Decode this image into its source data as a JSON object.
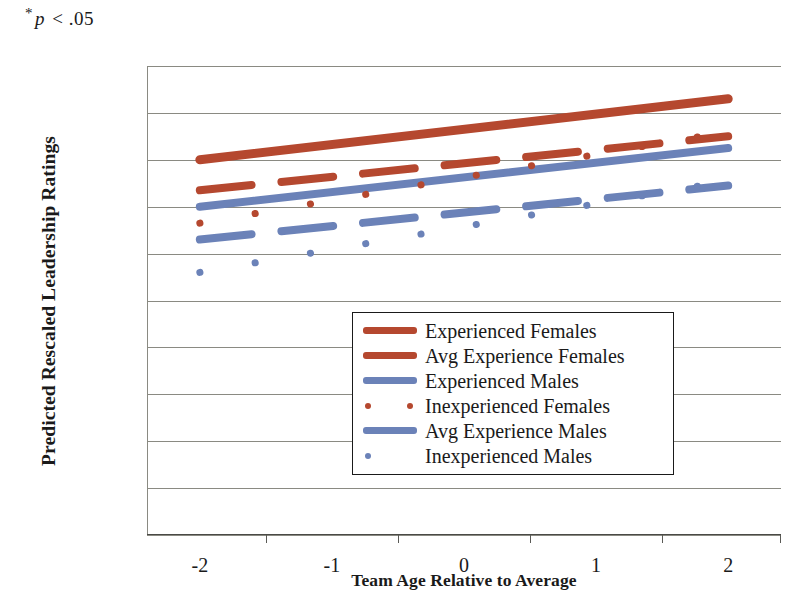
{
  "annotation": {
    "star": "*",
    "p_symbol": "p",
    "text": " < .05",
    "full": "* p < .05"
  },
  "colors": {
    "red": "#b5482f",
    "blue": "#6b82b8",
    "grid": "#8a8a82",
    "axis": "#4a4a46",
    "text": "#1a1a1a"
  },
  "axes": {
    "y_title": "Predicted Rescaled Leadership Ratings",
    "x_title": "Team Age Relative to Average"
  },
  "legend": {
    "items": [
      {
        "label": "Experienced Females",
        "key": "solid-line",
        "color": "#b5482f"
      },
      {
        "label": "Avg Experience Females",
        "key": "solid-line",
        "color": "#b5482f"
      },
      {
        "label": "Experienced Males",
        "key": "solid-line",
        "color": "#6b82b8"
      },
      {
        "label": "Inexperienced Females",
        "key": "dotted-line",
        "color": "#b5482f"
      },
      {
        "label": "Avg Experience Males",
        "key": "solid-line",
        "color": "#6b82b8"
      },
      {
        "label": "Inexperienced Males",
        "key": "dotted-line",
        "color": "#6b82b8"
      }
    ]
  },
  "chart_data": {
    "type": "line",
    "title": "",
    "xlabel": "Team Age Relative to Average",
    "ylabel": "Predicted Rescaled Leadership Ratings",
    "annotation": "* p < .05",
    "xlim": [
      -2.4,
      2.4
    ],
    "ylim": [
      0,
      1
    ],
    "xticks": [
      -2,
      -1,
      0,
      1,
      2
    ],
    "xtick_labels": [
      "-2",
      "-1",
      "0",
      "1",
      "2"
    ],
    "yticks": [
      0,
      0.1,
      0.2,
      0.3,
      0.4,
      0.5,
      0.6,
      0.7,
      0.8,
      0.9,
      1
    ],
    "ytick_labels": [
      "0",
      "0.1",
      "0.2",
      "0.3",
      "0.4",
      "0.5",
      "0.6",
      "0.7",
      "0.8",
      "0.9",
      "1"
    ],
    "grid": true,
    "legend_position": "center",
    "x": [
      -2,
      2
    ],
    "series": [
      {
        "name": "Experienced Females",
        "color": "#b5482f",
        "style": "solid",
        "width": 9,
        "values": [
          0.8,
          0.93
        ]
      },
      {
        "name": "Avg Experience Females",
        "color": "#b5482f",
        "style": "dashed",
        "width": 8,
        "values": [
          0.735,
          0.85
        ]
      },
      {
        "name": "Experienced Males",
        "color": "#6b82b8",
        "style": "solid",
        "width": 8,
        "values": [
          0.7,
          0.825
        ]
      },
      {
        "name": "Inexperienced Females",
        "color": "#b5482f",
        "style": "dotted",
        "width": 7,
        "values": [
          0.665,
          0.86
        ]
      },
      {
        "name": "Avg Experience Males",
        "color": "#6b82b8",
        "style": "dashed",
        "width": 8,
        "values": [
          0.63,
          0.745
        ]
      },
      {
        "name": "Inexperienced Males",
        "color": "#6b82b8",
        "style": "dotted",
        "width": 7,
        "values": [
          0.56,
          0.755
        ]
      }
    ]
  }
}
